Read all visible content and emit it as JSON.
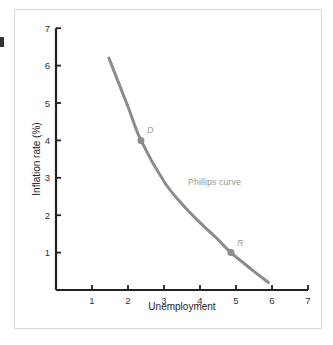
{
  "chart_data": {
    "type": "line",
    "title": "",
    "xlabel": "Unemployment",
    "ylabel": "Inflation rate (%)",
    "xlim": [
      0,
      7
    ],
    "ylim": [
      0,
      7
    ],
    "xticks": [
      "1",
      "2",
      "3",
      "4",
      "5",
      "6",
      "7"
    ],
    "yticks": [
      "1",
      "2",
      "3",
      "4",
      "5",
      "6",
      "7"
    ],
    "grid": false,
    "series": [
      {
        "name": "Phillips curve",
        "color": "#8c8c8c",
        "x": [
          1.47,
          2.0,
          2.36,
          3.0,
          3.5,
          4.0,
          4.5,
          4.86,
          5.5,
          5.9
        ],
        "y": [
          6.2,
          4.9,
          4.0,
          2.9,
          2.3,
          1.8,
          1.35,
          1.0,
          0.5,
          0.2
        ]
      }
    ],
    "points": [
      {
        "label": "D",
        "x": 2.36,
        "y": 4.0
      },
      {
        "label": "R",
        "x": 4.86,
        "y": 1.0
      }
    ],
    "annotations": [
      {
        "text": "Phillips curve",
        "x": 3.5,
        "y": 2.9
      }
    ]
  },
  "labels": {
    "xlabel": "Unemployment",
    "ylabel": "Inflation rate (%)",
    "curve": "Phillips curve",
    "point_d": "D",
    "point_r": "R"
  }
}
